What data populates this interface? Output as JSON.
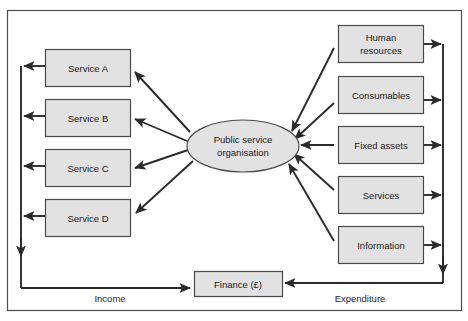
{
  "diagram": {
    "frame": {
      "stroke": "#4d4d4d"
    },
    "style": {
      "box_fill": "#e2e2e2",
      "box_stroke": "#4a4a4a",
      "ellipse_fill": "#e2e2e2",
      "ellipse_stroke": "#4a4a4a",
      "arrow_color": "#2b2b2b",
      "text_color": "#1a1a1a",
      "background": "#ffffff"
    },
    "centre": {
      "id": "public-service-organisation",
      "line1": "Public service",
      "line2": "organisation"
    },
    "outputs": {
      "group_label": "Income",
      "items": [
        {
          "id": "service-a",
          "label": "Service A"
        },
        {
          "id": "service-b",
          "label": "Service B"
        },
        {
          "id": "service-c",
          "label": "Service C"
        },
        {
          "id": "service-d",
          "label": "Service D"
        }
      ]
    },
    "inputs": {
      "group_label": "Expenditure",
      "items": [
        {
          "id": "human-resources",
          "line1": "Human",
          "line2": "resources"
        },
        {
          "id": "consumables",
          "line1": "Consumables",
          "line2": ""
        },
        {
          "id": "fixed-assets",
          "line1": "Fixed assets",
          "line2": ""
        },
        {
          "id": "services",
          "line1": "Services",
          "line2": ""
        },
        {
          "id": "information",
          "line1": "Information",
          "line2": ""
        }
      ]
    },
    "finance": {
      "id": "finance",
      "label": "Finance (£)"
    },
    "flow_labels": {
      "income": "Income",
      "expenditure": "Expenditure"
    }
  }
}
